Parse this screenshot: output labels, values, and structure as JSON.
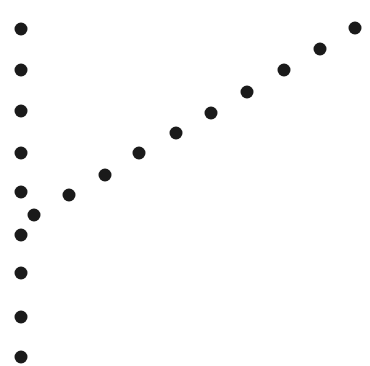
{
  "figure": {
    "width": 370,
    "height": 366,
    "background_color": "#ffffff",
    "marker_color": "#1a1a1a",
    "marker_shape": "circle",
    "marker_diameter": 13,
    "title": "",
    "axes_visible": false,
    "gridlines_visible": false,
    "tick_labels_visible": false,
    "legend_visible": false
  },
  "chart_data": {
    "type": "scatter",
    "title": "",
    "xlabel": "",
    "ylabel": "",
    "xlim": [
      0,
      370
    ],
    "ylim": [
      0,
      366
    ],
    "grid": false,
    "legend": false,
    "axes": false,
    "note": "Two point groups in pixel coordinates: a vertical column of 9 markers and a diagonal rising run of 10 markers meeting near the lower left.",
    "series": [
      {
        "name": "vertical-column",
        "marker": "circle",
        "color": "#1a1a1a",
        "count": 9,
        "points": [
          {
            "x": 21,
            "y": 29
          },
          {
            "x": 21,
            "y": 70
          },
          {
            "x": 21,
            "y": 111
          },
          {
            "x": 21,
            "y": 153
          },
          {
            "x": 21,
            "y": 192
          },
          {
            "x": 21,
            "y": 235
          },
          {
            "x": 21,
            "y": 273
          },
          {
            "x": 21,
            "y": 317
          },
          {
            "x": 21,
            "y": 357
          }
        ]
      },
      {
        "name": "diagonal-run",
        "marker": "circle",
        "color": "#1a1a1a",
        "count": 10,
        "points": [
          {
            "x": 34,
            "y": 215
          },
          {
            "x": 69,
            "y": 195
          },
          {
            "x": 105,
            "y": 175
          },
          {
            "x": 139,
            "y": 153
          },
          {
            "x": 176,
            "y": 133
          },
          {
            "x": 211,
            "y": 113
          },
          {
            "x": 247,
            "y": 92
          },
          {
            "x": 284,
            "y": 70
          },
          {
            "x": 320,
            "y": 49
          },
          {
            "x": 355,
            "y": 28
          }
        ]
      }
    ]
  }
}
